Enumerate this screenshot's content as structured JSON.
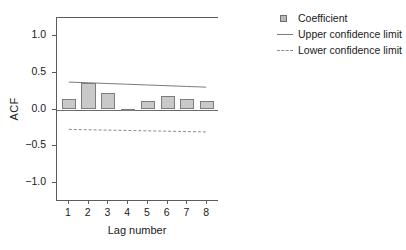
{
  "chart_data": {
    "type": "bar",
    "title": "",
    "xlabel": "Lag number",
    "ylabel": "ACF",
    "categories": [
      "1",
      "2",
      "3",
      "4",
      "5",
      "6",
      "7",
      "8"
    ],
    "values": [
      0.15,
      0.36,
      0.22,
      0.01,
      0.12,
      0.19,
      0.15,
      0.11
    ],
    "series": [
      {
        "name": "Coefficient",
        "values": [
          0.15,
          0.36,
          0.22,
          0.01,
          0.12,
          0.19,
          0.15,
          0.11
        ]
      },
      {
        "name": "Upper confidence limit",
        "values": [
          0.37,
          0.36,
          0.35,
          0.34,
          0.33,
          0.32,
          0.31,
          0.3
        ]
      },
      {
        "name": "Lower confidence limit",
        "values": [
          -0.28,
          -0.285,
          -0.29,
          -0.295,
          -0.3,
          -0.305,
          -0.31,
          -0.315
        ]
      }
    ],
    "ylim": [
      -1.25,
      1.25
    ],
    "yticks": [
      1.0,
      0.5,
      0.0,
      -0.5,
      -1.0
    ],
    "ytick_labels": [
      "1.0",
      "0.5",
      "0.0",
      "-0.5",
      "-1.0"
    ],
    "xlim": [
      0.4,
      8.6
    ],
    "grid": false,
    "legend_position": "right-top",
    "colors": {
      "bar_fill": "#c9c9c9",
      "bar_border": "#7d7d7d",
      "upper_limit_line": "#7a7a7a",
      "lower_limit_line": "#8a8a8a",
      "axis": "#5c5c5c"
    }
  },
  "axes": {
    "y_title": "ACF",
    "x_title": "Lag number",
    "y_ticks": [
      {
        "label": "1.0",
        "value": 1.0
      },
      {
        "label": "0.5",
        "value": 0.5
      },
      {
        "label": "0.0",
        "value": 0.0
      },
      {
        "label": "-0.5",
        "value": -0.5
      },
      {
        "label": "-1.0",
        "value": -1.0
      }
    ],
    "x_ticks": [
      {
        "label": "1",
        "value": 1
      },
      {
        "label": "2",
        "value": 2
      },
      {
        "label": "3",
        "value": 3
      },
      {
        "label": "4",
        "value": 4
      },
      {
        "label": "5",
        "value": 5
      },
      {
        "label": "6",
        "value": 6
      },
      {
        "label": "7",
        "value": 7
      },
      {
        "label": "8",
        "value": 8
      }
    ]
  },
  "legend": {
    "items": [
      {
        "label": "Coefficient",
        "marker": "square-swatch-icon"
      },
      {
        "label": "Upper confidence limit",
        "marker": "solid-line-icon"
      },
      {
        "label": "Lower confidence limit",
        "marker": "dashed-line-icon"
      }
    ]
  }
}
